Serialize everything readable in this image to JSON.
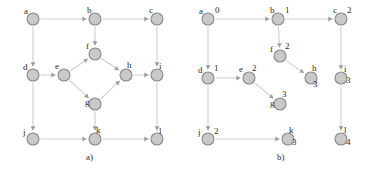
{
  "figure": {
    "background_color": "#ffffff",
    "node_fill": "#c9c9c9",
    "node_stroke": "#8a8a8a",
    "edge_color": "#cfcfcf",
    "arrow_color": "#9d9d9d",
    "text_color": "#2b2b2b"
  },
  "panels": [
    {
      "id": "panel-a",
      "caption": "a)",
      "caption_x": 86,
      "caption_y": 160,
      "shows_distances": false,
      "nodes": [
        {
          "id": "a",
          "label": "a",
          "x": 33,
          "y": 19,
          "r": 6,
          "label_dx": -9,
          "label_dy": -5,
          "dist": ""
        },
        {
          "id": "b",
          "label": "b",
          "x": 95,
          "y": 19,
          "r": 6,
          "label_dx": -8,
          "label_dy": -6,
          "dist": ""
        },
        {
          "id": "c",
          "label": "c",
          "x": 157,
          "y": 19,
          "r": 6,
          "label_dx": -8,
          "label_dy": -6,
          "dist": ""
        },
        {
          "id": "f",
          "label": "f",
          "x": 95,
          "y": 54,
          "r": 6,
          "label_dx": -9,
          "label_dy": -5,
          "dist": ""
        },
        {
          "id": "d",
          "label": "d",
          "x": 33,
          "y": 75,
          "r": 6,
          "label_dx": -10,
          "label_dy": -5,
          "dist": ""
        },
        {
          "id": "e",
          "label": "e",
          "x": 64,
          "y": 75,
          "r": 6,
          "label_dx": -9,
          "label_dy": -6,
          "dist": ""
        },
        {
          "id": "h",
          "label": "h",
          "x": 126,
          "y": 75,
          "r": 6,
          "label_dx": 1,
          "label_dy": -7,
          "dist": ""
        },
        {
          "id": "i",
          "label": "i",
          "x": 157,
          "y": 75,
          "r": 6,
          "label_dx": 2,
          "label_dy": -6,
          "dist": ""
        },
        {
          "id": "g",
          "label": "g",
          "x": 95,
          "y": 104,
          "r": 6,
          "label_dx": -10,
          "label_dy": 1,
          "dist": ""
        },
        {
          "id": "j",
          "label": "j",
          "x": 33,
          "y": 139,
          "r": 6,
          "label_dx": -10,
          "label_dy": -4,
          "dist": ""
        },
        {
          "id": "k",
          "label": "k",
          "x": 95,
          "y": 139,
          "r": 6,
          "label_dx": 1,
          "label_dy": -6,
          "dist": ""
        },
        {
          "id": "l",
          "label": "l",
          "x": 157,
          "y": 139,
          "r": 6,
          "label_dx": 2,
          "label_dy": -5,
          "dist": ""
        }
      ],
      "edges": [
        {
          "from": "a",
          "to": "b",
          "arrow": true
        },
        {
          "from": "b",
          "to": "c",
          "arrow": true
        },
        {
          "from": "a",
          "to": "d",
          "arrow": true
        },
        {
          "from": "b",
          "to": "f",
          "arrow": true
        },
        {
          "from": "c",
          "to": "i",
          "arrow": true
        },
        {
          "from": "d",
          "to": "e",
          "arrow": true
        },
        {
          "from": "e",
          "to": "f",
          "arrow": true
        },
        {
          "from": "e",
          "to": "g",
          "arrow": true
        },
        {
          "from": "f",
          "to": "h",
          "arrow": true
        },
        {
          "from": "g",
          "to": "h",
          "arrow": true
        },
        {
          "from": "h",
          "to": "i",
          "arrow": true
        },
        {
          "from": "d",
          "to": "j",
          "arrow": true
        },
        {
          "from": "g",
          "to": "k",
          "arrow": true
        },
        {
          "from": "i",
          "to": "l",
          "arrow": true
        },
        {
          "from": "j",
          "to": "k",
          "arrow": true
        },
        {
          "from": "k",
          "to": "l",
          "arrow": true
        }
      ]
    },
    {
      "id": "panel-b",
      "caption": "b)",
      "caption_x": 277,
      "caption_y": 160,
      "shows_distances": true,
      "nodes": [
        {
          "id": "a",
          "label": "a",
          "x": 208,
          "y": 19,
          "r": 6,
          "label_dx": -9,
          "label_dy": -5,
          "dist": "0",
          "dist_dx": 7,
          "dist_dy": -6
        },
        {
          "id": "b",
          "label": "b",
          "x": 278,
          "y": 19,
          "r": 6,
          "label_dx": -8,
          "label_dy": -6,
          "dist": "1",
          "dist_dy": -6,
          "dist_dx": 7
        },
        {
          "id": "c",
          "label": "c",
          "x": 341,
          "y": 19,
          "r": 6,
          "label_dx": -8,
          "label_dy": -6,
          "dist": "2",
          "dist_dx": 6,
          "dist_dy": -6
        },
        {
          "id": "f",
          "label": "f",
          "x": 280,
          "y": 56,
          "r": 6,
          "label_dx": -10,
          "label_dy": -4,
          "dist": "2",
          "dist_dx": 5,
          "dist_dy": -7
        },
        {
          "id": "d",
          "label": "d",
          "x": 208,
          "y": 78,
          "r": 6,
          "label_dx": -10,
          "label_dy": -5,
          "dist": "1",
          "dist_dx": 6,
          "dist_dy": -7
        },
        {
          "id": "e",
          "label": "e",
          "x": 249,
          "y": 78,
          "r": 6,
          "label_dx": -10,
          "label_dy": -6,
          "dist": "2",
          "dist_dx": 3,
          "dist_dy": -7
        },
        {
          "id": "h",
          "label": "h",
          "x": 311,
          "y": 78,
          "r": 6,
          "label_dx": 1,
          "label_dy": -7,
          "dist": "3",
          "dist_dx": 2,
          "dist_dy": 9
        },
        {
          "id": "i",
          "label": "i",
          "x": 341,
          "y": 78,
          "r": 6,
          "label_dx": 3,
          "label_dy": -6,
          "dist": "3",
          "dist_dx": 5,
          "dist_dy": 5
        },
        {
          "id": "g",
          "label": "g",
          "x": 280,
          "y": 104,
          "r": 6,
          "label_dx": -10,
          "label_dy": 2,
          "dist": "3",
          "dist_dx": 2,
          "dist_dy": -7
        },
        {
          "id": "j",
          "label": "j",
          "x": 208,
          "y": 139,
          "r": 6,
          "label_dx": -10,
          "label_dy": -4,
          "dist": "2",
          "dist_dx": 6,
          "dist_dy": -5
        },
        {
          "id": "k",
          "label": "k",
          "x": 288,
          "y": 139,
          "r": 6,
          "label_dx": 1,
          "label_dy": -6,
          "dist": "3",
          "dist_dx": 4,
          "dist_dy": 6
        },
        {
          "id": "l",
          "label": "l",
          "x": 341,
          "y": 139,
          "r": 6,
          "label_dx": 3,
          "label_dy": -6,
          "dist": "4",
          "dist_dx": 5,
          "dist_dy": 6
        }
      ],
      "edges": [
        {
          "from": "a",
          "to": "b",
          "arrow": true
        },
        {
          "from": "b",
          "to": "c",
          "arrow": true
        },
        {
          "from": "a",
          "to": "d",
          "arrow": true
        },
        {
          "from": "b",
          "to": "f",
          "arrow": true
        },
        {
          "from": "c",
          "to": "i",
          "arrow": true
        },
        {
          "from": "d",
          "to": "e",
          "arrow": true
        },
        {
          "from": "f",
          "to": "h",
          "arrow": true
        },
        {
          "from": "e",
          "to": "g",
          "arrow": true
        },
        {
          "from": "d",
          "to": "j",
          "arrow": true
        },
        {
          "from": "i",
          "to": "l",
          "arrow": true
        },
        {
          "from": "j",
          "to": "k",
          "arrow": true
        }
      ]
    }
  ]
}
